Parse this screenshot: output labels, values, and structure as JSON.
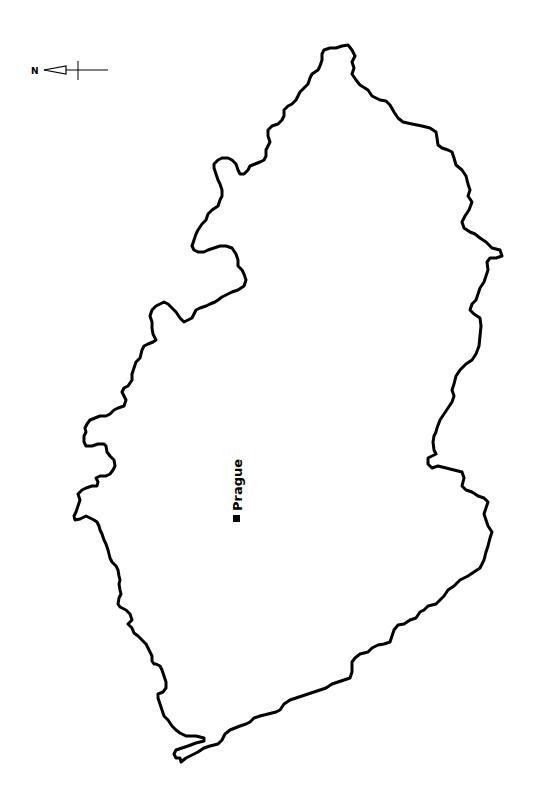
{
  "map": {
    "title": "Outline map",
    "orientation": "rotated 90° (north points left)",
    "border_color": "#000000",
    "fill_color": "#ffffff",
    "background": "#ffffff"
  },
  "compass": {
    "letter": "N",
    "icon": "north-arrow-icon",
    "direction": "left"
  },
  "cities": [
    {
      "name": "Prague",
      "marker": "square-marker-icon"
    }
  ]
}
